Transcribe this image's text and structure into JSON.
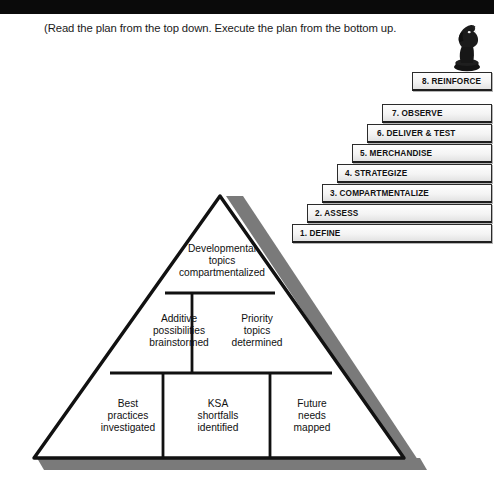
{
  "caption": {
    "text": "(Read the plan from the top down. Execute the plan from the bottom up."
  },
  "decor": {
    "top_bar_color": "#0a0a0a",
    "shadow_color": "#7a7a7a",
    "knight_name": "chess-knight-piece",
    "knight_color": "#1a1a1a"
  },
  "staircase": {
    "steps": [
      {
        "label": "1. DEFINE"
      },
      {
        "label": "2. ASSESS"
      },
      {
        "label": "3. COMPARTMENTALIZE"
      },
      {
        "label": "4. STRATEGIZE"
      },
      {
        "label": "5. MERCHANDISE"
      },
      {
        "label": "6. DELIVER & TEST"
      },
      {
        "label": "7. OBSERVE"
      },
      {
        "label": "8. REINFORCE"
      }
    ]
  },
  "pyramid": {
    "tiers": [
      {
        "name": "top-tier",
        "cells": [
          {
            "label": "Developmental\ntopics\ncompartmentalized"
          }
        ]
      },
      {
        "name": "middle-tier",
        "cells": [
          {
            "label": "Additive\npossibilities\nbrainstormed"
          },
          {
            "label": "Priority\ntopics\ndetermined"
          }
        ]
      },
      {
        "name": "bottom-tier",
        "cells": [
          {
            "label": "Best\npractices\ninvestigated"
          },
          {
            "label": "KSA\nshortfalls\nidentified"
          },
          {
            "label": "Future\nneeds\nmapped"
          }
        ]
      }
    ]
  }
}
